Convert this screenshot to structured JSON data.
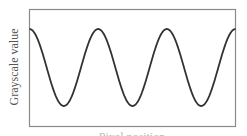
{
  "chart_data": {
    "type": "line",
    "title": "",
    "xlabel": "Pixel position",
    "ylabel": "Grayscale value",
    "grid": false,
    "legend": null,
    "axis_ticks": false,
    "series": [
      {
        "name": "grayscale profile",
        "shape": "cosine",
        "cycles": 3,
        "starts_at": "peak",
        "ends_at": "peak",
        "color": "#333333"
      }
    ],
    "x": [
      0,
      0.5,
      1,
      1.5,
      2,
      2.5,
      3
    ],
    "values": [
      1,
      0,
      1,
      0,
      1,
      0,
      1
    ]
  },
  "colors": {
    "frame": "#888888",
    "line": "#333333",
    "label": "#555555"
  }
}
